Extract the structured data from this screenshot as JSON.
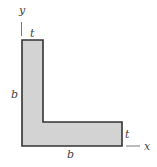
{
  "diagram": {
    "type": "L-shaped cross-section (angle)",
    "fill_color": "#d3d3d3",
    "stroke_color": "#333333",
    "labels": {
      "y_axis": "y",
      "x_axis": "x",
      "top_thickness": "t",
      "right_thickness": "t",
      "height": "b",
      "width": "b"
    }
  }
}
